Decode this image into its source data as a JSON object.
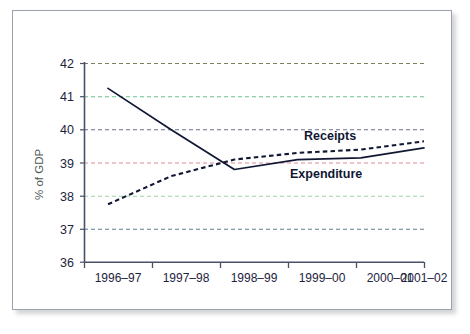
{
  "figure": {
    "background_color": "#ffffff",
    "panel_border_color": "#9aa0ac",
    "shadow_color": "#7b8089"
  },
  "axis": {
    "y_label": "% of GDP",
    "y_ticks": [
      "36",
      "37",
      "38",
      "39",
      "40",
      "41",
      "42"
    ],
    "x_ticks": [
      "1996–97",
      "1997–98",
      "1998–99",
      "1999–00",
      "2000–01",
      "2001–02"
    ],
    "axis_color": "#4a5068"
  },
  "annotations": {
    "receipts_label": "Receipts",
    "expenditure_label": "Expenditure"
  },
  "gridlines": {
    "colors": {
      "42": "#7f7f5a",
      "41": "#69c48a",
      "40": "#6c6f8e",
      "39": "#d98a95",
      "38": "#9fd3a8",
      "37": "#5f7f8f"
    }
  },
  "chart_data": {
    "type": "line",
    "title": "",
    "xlabel": "",
    "ylabel": "% of GDP",
    "ylim": [
      36,
      42
    ],
    "grid": true,
    "legend": "inline-annotation",
    "categories": [
      "1996–97",
      "1997–98",
      "1998–99",
      "1999–00",
      "2000–01",
      "2001–02"
    ],
    "series": [
      {
        "name": "Expenditure",
        "style": "solid",
        "color": "#101733",
        "values": [
          41.25,
          40.0,
          38.8,
          39.1,
          39.15,
          39.45
        ]
      },
      {
        "name": "Receipts",
        "style": "dashed",
        "color": "#101733",
        "values": [
          37.75,
          38.6,
          39.1,
          39.3,
          39.4,
          39.65
        ]
      }
    ]
  }
}
